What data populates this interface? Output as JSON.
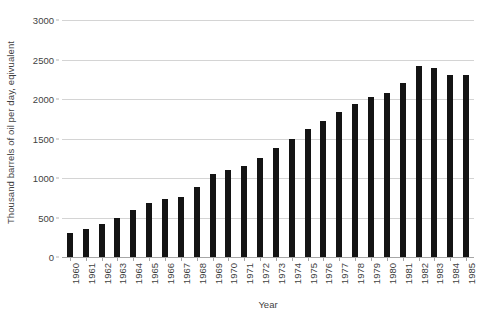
{
  "chart_data": {
    "type": "bar",
    "title": "",
    "subtitle": "",
    "xlabel": "Year",
    "ylabel": "Thousand barrels of oil per day, eqivualent",
    "categories": [
      "1960",
      "1961",
      "1962",
      "1963",
      "1964",
      "1965",
      "1966",
      "1967",
      "1968",
      "1969",
      "1970",
      "1971",
      "1972",
      "1973",
      "1974",
      "1975",
      "1976",
      "1977",
      "1978",
      "1979",
      "1980",
      "1981",
      "1982",
      "1983",
      "1984",
      "1985"
    ],
    "values": [
      300,
      350,
      420,
      500,
      600,
      680,
      740,
      760,
      880,
      1050,
      1100,
      1150,
      1250,
      1380,
      1500,
      1620,
      1720,
      1830,
      1940,
      2020,
      2080,
      2200,
      2420,
      2390,
      2300,
      2300
    ],
    "series": [
      {
        "name": "Thousand barrels of oil per day, eqivualent",
        "values": [
          300,
          350,
          420,
          500,
          600,
          680,
          740,
          760,
          880,
          1050,
          1100,
          1150,
          1250,
          1380,
          1500,
          1620,
          1720,
          1830,
          1940,
          2020,
          2080,
          2200,
          2420,
          2390,
          2300,
          2300
        ]
      }
    ],
    "ylim": [
      0,
      3000
    ],
    "yticks": [
      0,
      500,
      1000,
      1500,
      2000,
      2500,
      3000
    ],
    "ytick_labels": [
      "0",
      "500",
      "1000",
      "1500",
      "2000",
      "2500",
      "3000"
    ],
    "grid": true,
    "grid_axis": "y",
    "legend": false,
    "legend_position": "none",
    "bar_color": "#141414",
    "grid_color": "#d4d4d4",
    "axis_color": "#a6a6a6",
    "text_color": "#3f3f3f",
    "background": "#ffffff",
    "xtick_rotation": -90
  }
}
